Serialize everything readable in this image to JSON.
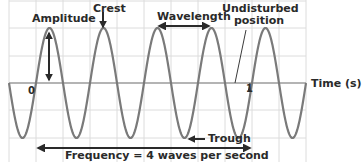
{
  "diagram": {
    "type": "transverse-wave",
    "labels": {
      "amplitude": "Amplitude",
      "crest": "Crest",
      "wavelength": "Wavelength",
      "undisturbed_line1": "Undisturbed",
      "undisturbed_line2": "position",
      "trough": "Trough",
      "frequency": "Frequency = 4 waves per second",
      "time_axis": "Time (s)",
      "tick_zero": "0",
      "tick_one": "1"
    },
    "colors": {
      "wave": "#7a7a7a",
      "arrow": "#2a2a2a",
      "grid": "#dcdcdc",
      "axis": "#b4b4b4",
      "text": "#2a2a2a"
    },
    "wave": {
      "cycles_per_second": 4,
      "x_start_s": -0.125,
      "x_end_s": 1.25,
      "amplitude": 1
    }
  },
  "chart_data": {
    "type": "line",
    "title": "",
    "xlabel": "Time (s)",
    "ylabel": "",
    "x_ticks": [
      "0",
      "1"
    ],
    "xlim": [
      -0.125,
      1.25
    ],
    "ylim": [
      -1,
      1
    ],
    "grid": true,
    "series": [
      {
        "name": "wave",
        "function": "sin(2*pi*4*t)",
        "frequency_hz": 4,
        "amplitude": 1
      }
    ],
    "annotations": [
      "Amplitude",
      "Crest",
      "Wavelength",
      "Undisturbed position",
      "Trough",
      "Frequency = 4 waves per second"
    ]
  }
}
